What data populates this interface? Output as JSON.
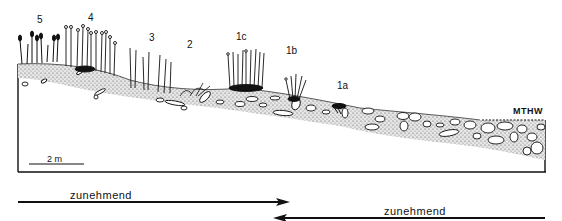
{
  "figure": {
    "type": "beach profile cross-section",
    "zone_labels": [
      {
        "id": "5",
        "label": "5",
        "x": 10,
        "y": 16
      },
      {
        "id": "4",
        "label": "4",
        "x": 89,
        "y": 15
      },
      {
        "id": "3",
        "label": "3",
        "x": 149,
        "y": 35
      },
      {
        "id": "2",
        "label": "2",
        "x": 188,
        "y": 42
      },
      {
        "id": "1c",
        "label": "1c",
        "x": 236,
        "y": 33
      },
      {
        "id": "1b",
        "label": "1b",
        "x": 287,
        "y": 47
      },
      {
        "id": "1a",
        "label": "1a",
        "x": 337,
        "y": 82
      }
    ],
    "water_level_label": "MTHW",
    "scale_bar": {
      "label": "2 m",
      "length_px": 55
    },
    "arrows": [
      {
        "label": "zunehmend",
        "direction": "right",
        "from_x": 18,
        "to_x": 288,
        "y": 202
      },
      {
        "label": "zunehmend",
        "direction": "left",
        "from_x": 545,
        "to_x": 274,
        "y": 218
      }
    ]
  }
}
